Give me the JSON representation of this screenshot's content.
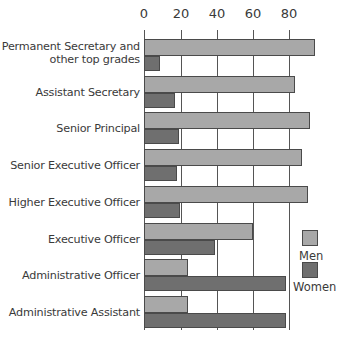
{
  "chart_data": {
    "type": "bar",
    "orientation": "horizontal",
    "title": "",
    "xlabel": "",
    "ylabel": "",
    "xlim": [
      0,
      100
    ],
    "xticks": [
      0,
      20,
      40,
      60,
      80
    ],
    "grid": true,
    "legend_position": "right-bottom",
    "categories": [
      "Permanent Secretary and other top grades",
      "Assistant Secretary",
      "Senior Principal",
      "Senior Executive Officer",
      "Higher Executive Officer",
      "Executive Officer",
      "Administrative Officer",
      "Administrative Assistant"
    ],
    "series": [
      {
        "name": "Men",
        "color": "#a8a8a8",
        "values": [
          94,
          83,
          91,
          87,
          90,
          60,
          24,
          24
        ]
      },
      {
        "name": "Women",
        "color": "#6f6f6f",
        "values": [
          9,
          17,
          19,
          18,
          20,
          39,
          78,
          78
        ]
      }
    ]
  },
  "labels": {
    "cat0_line1": "Permanent Secretary and",
    "cat0_line2": "other top grades",
    "cat1": "Assistant Secretary",
    "cat2": "Senior Principal",
    "cat3": "Senior Executive Officer",
    "cat4": "Higher Executive Officer",
    "cat5": "Executive Officer",
    "cat6": "Administrative Officer",
    "cat7": "Administrative Assistant"
  },
  "ticks": [
    "0",
    "20",
    "40",
    "60",
    "80"
  ],
  "legend": {
    "men": "Men",
    "women": "Women"
  }
}
